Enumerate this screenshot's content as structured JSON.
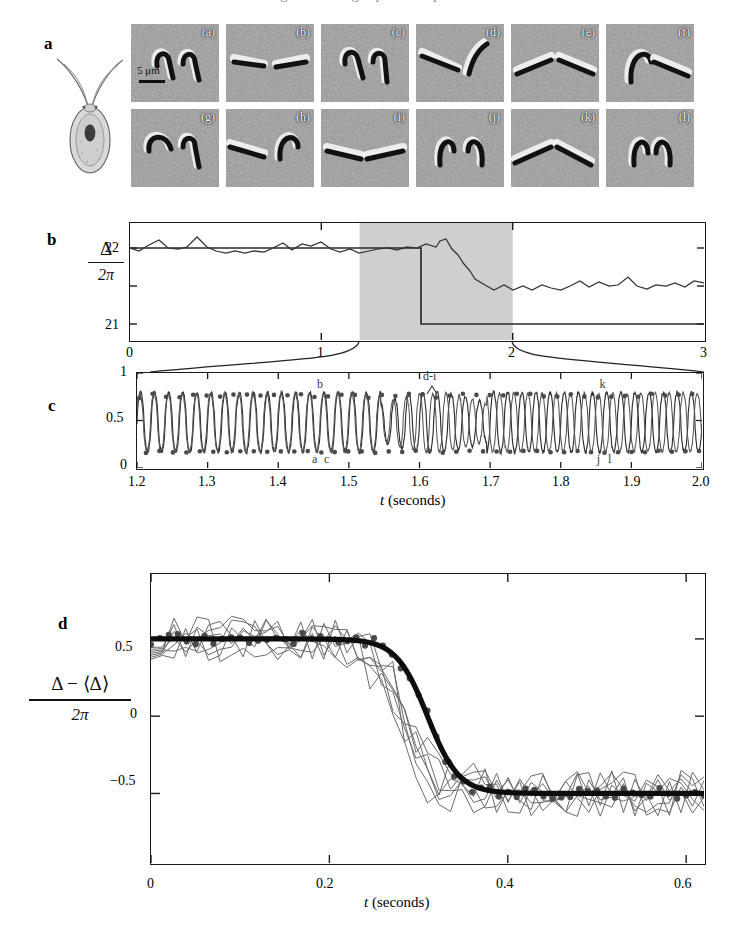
{
  "figure": {
    "top_cropped_caption": "oscillation of the two flagella during a phase slip",
    "panels": [
      "a",
      "b",
      "c",
      "d"
    ]
  },
  "panel_a": {
    "letter": "a",
    "organism_label": "Chlamydomonas cell with two flagella",
    "scale_bar": "5 μm",
    "micrograph_tags": [
      "(a)",
      "(b)",
      "(c)",
      "(d)",
      "(e)",
      "(f)",
      "(g)",
      "(h)",
      "(i)",
      "(j)",
      "(k)",
      "(l)"
    ],
    "rows": 2,
    "cols": 6
  },
  "panel_b": {
    "letter": "b",
    "ylabel_num": "Δ",
    "ylabel_den": "2π",
    "yticks": [
      "22",
      "21"
    ],
    "xticks": [
      "0",
      "1",
      "2",
      "3"
    ],
    "shaded_region": [
      1.2,
      2.0
    ],
    "shade_color": "#cfcfcf"
  },
  "panel_c": {
    "letter": "c",
    "yticks": [
      "1",
      "0.5",
      "0"
    ],
    "xticks": [
      "1.2",
      "1.3",
      "1.4",
      "1.5",
      "1.6",
      "1.7",
      "1.8",
      "1.9",
      "2.0"
    ],
    "xlabel_italic": "t",
    "xlabel_rest": "(seconds)",
    "annotations": [
      {
        "text": "b",
        "t": 1.462,
        "y": 0.86
      },
      {
        "text": "a",
        "t": 1.455,
        "y": 0.075
      },
      {
        "text": "c",
        "t": 1.472,
        "y": 0.075
      },
      {
        "text": "d-i",
        "t": 1.612,
        "y": 0.95
      },
      {
        "text": "k",
        "t": 1.862,
        "y": 0.86
      },
      {
        "text": "j",
        "t": 1.858,
        "y": 0.075
      },
      {
        "text": "l",
        "t": 1.874,
        "y": 0.075
      }
    ]
  },
  "panel_d": {
    "letter": "d",
    "ylabel_num": "Δ − ⟨Δ⟩",
    "ylabel_den": "2π",
    "yticks": [
      "0.5",
      "0",
      "−0.5"
    ],
    "xticks": [
      "0",
      "0.2",
      "0.4",
      "0.6"
    ],
    "xlabel_italic": "t",
    "xlabel_rest": "(seconds)",
    "n_thin_traces": 7,
    "marker_color": "#4a4a4a"
  },
  "chart_data": [
    {
      "id": "panel_b",
      "type": "line",
      "title": "",
      "xlabel": "",
      "ylabel": "Δ / 2π",
      "xlim": [
        0,
        3
      ],
      "ylim": [
        20.55,
        22.35
      ],
      "xticks": [
        0,
        1,
        2,
        3
      ],
      "yticks": [
        21,
        22
      ],
      "grid": false,
      "legend": "none",
      "shaded_span": {
        "x0": 1.2,
        "x1": 2.0,
        "color": "#cfcfcf"
      },
      "series": [
        {
          "name": "staircase",
          "style": "step",
          "x": [
            0.0,
            1.52,
            1.52,
            1.64,
            1.64,
            3.0
          ],
          "y": [
            22.0,
            22.0,
            22.0,
            22.0,
            21.0,
            21.0
          ]
        },
        {
          "name": "noisy phase difference",
          "style": "line",
          "x": [
            0.0,
            0.05,
            0.1,
            0.15,
            0.2,
            0.25,
            0.3,
            0.35,
            0.4,
            0.45,
            0.5,
            0.55,
            0.6,
            0.65,
            0.7,
            0.75,
            0.8,
            0.85,
            0.9,
            0.95,
            1.0,
            1.05,
            1.1,
            1.15,
            1.2,
            1.25,
            1.3,
            1.35,
            1.4,
            1.45,
            1.5,
            1.55,
            1.6,
            1.62,
            1.65,
            1.68,
            1.71,
            1.74,
            1.77,
            1.8,
            1.85,
            1.9,
            1.95,
            2.0,
            2.05,
            2.1,
            2.15,
            2.2,
            2.25,
            2.3,
            2.35,
            2.4,
            2.45,
            2.5,
            2.55,
            2.6,
            2.65,
            2.7,
            2.75,
            2.8,
            2.85,
            2.9,
            2.95,
            3.0
          ],
          "y": [
            22.0,
            21.93,
            22.05,
            22.18,
            22.0,
            21.97,
            22.02,
            22.25,
            22.02,
            21.93,
            21.87,
            21.93,
            21.87,
            21.93,
            21.9,
            22.0,
            22.12,
            21.96,
            22.1,
            22.04,
            22.14,
            21.98,
            21.91,
            21.97,
            21.9,
            21.95,
            21.99,
            22.02,
            21.97,
            22.04,
            22.01,
            22.13,
            22.05,
            22.21,
            22.26,
            21.99,
            21.82,
            21.6,
            21.42,
            21.2,
            21.04,
            20.91,
            21.05,
            20.92,
            21.0,
            20.9,
            21.03,
            20.95,
            20.92,
            21.0,
            21.12,
            20.98,
            21.1,
            21.0,
            21.02,
            21.22,
            21.0,
            20.93,
            21.01,
            21.0,
            21.08,
            20.97,
            21.1,
            21.05
          ]
        }
      ]
    },
    {
      "id": "panel_c",
      "type": "line",
      "title": "",
      "xlabel": "t (seconds)",
      "ylabel": "",
      "xlim": [
        1.2,
        2.0
      ],
      "ylim": [
        0,
        1
      ],
      "xticks": [
        1.2,
        1.3,
        1.4,
        1.5,
        1.6,
        1.7,
        1.8,
        1.9,
        2.0
      ],
      "yticks": [
        0,
        0.5,
        1
      ],
      "grid": false,
      "legend": "none",
      "description": "Two overlapping near-sinusoidal flagellar beat phase traces oscillating between ~0.15 and ~0.8 at about 50 Hz, with a region of reduced amplitude / beat-frequency mismatch near t = 1.55-1.68 s where the phase slip occurs.",
      "series": [
        {
          "name": "left flagellum",
          "frequency_hz": 50.0,
          "amplitude": 0.32,
          "offset": 0.48
        },
        {
          "name": "right flagellum",
          "frequency_hz": 50.6,
          "amplitude": 0.31,
          "offset": 0.48
        }
      ],
      "markers": "peak and trough dots marking frames a-l"
    },
    {
      "id": "panel_d",
      "type": "line",
      "title": "",
      "xlabel": "t (seconds)",
      "ylabel": "(Δ − ⟨Δ⟩) / 2π",
      "xlim": [
        0,
        0.62
      ],
      "ylim": [
        -0.95,
        0.92
      ],
      "xticks": [
        0,
        0.2,
        0.4,
        0.6
      ],
      "yticks": [
        -0.5,
        0,
        0.5
      ],
      "grid": false,
      "legend": "none",
      "description": "Seven individual phase-slip events (thin grey) aligned and overlaid, with mean data points (dots) and a smooth sigmoidal fit (thick black) dropping from +0.5 to -0.5 over about 0.1 s centred near t = 0.31 s.",
      "series": [
        {
          "name": "sigmoid fit",
          "style": "thick",
          "model": "tanh",
          "plateau_high": 0.5,
          "plateau_low": -0.5,
          "center": 0.31,
          "width": 0.035
        }
      ]
    }
  ]
}
